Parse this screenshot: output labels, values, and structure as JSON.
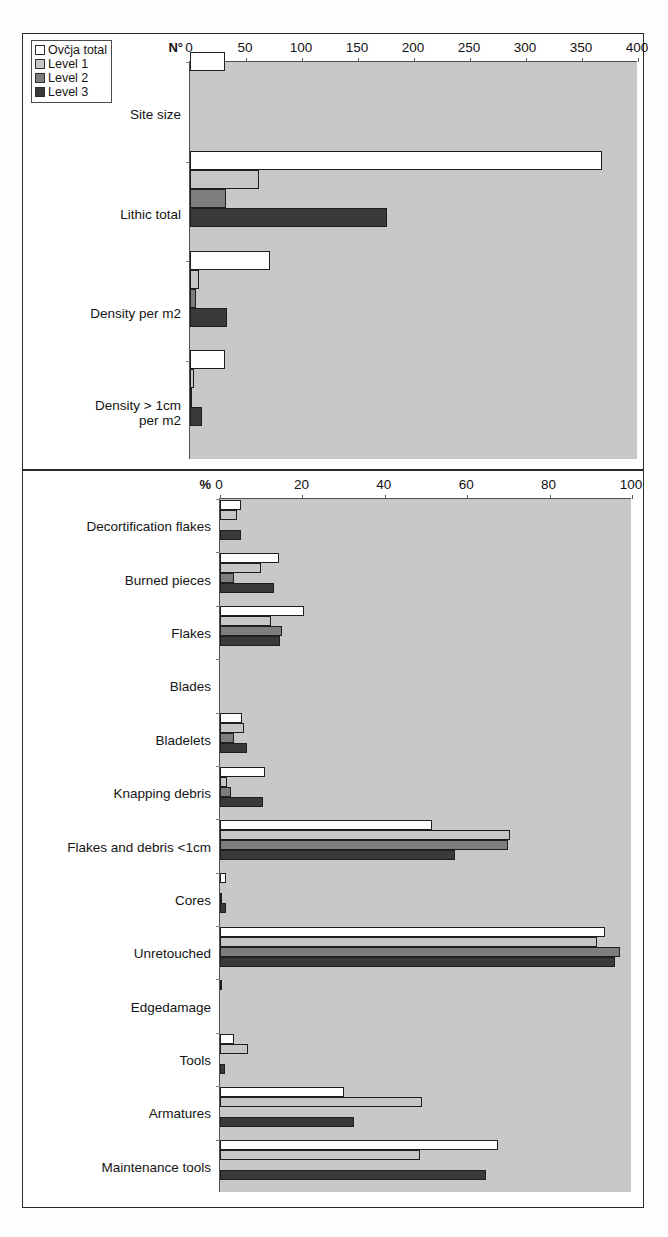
{
  "figure": {
    "title": "",
    "legend": {
      "position": "top-left",
      "items": [
        {
          "label": "Ovčja total",
          "color": "#ffffff",
          "key": "ovcja_total"
        },
        {
          "label": "Level 1",
          "color": "#c6c6c6",
          "key": "level_1"
        },
        {
          "label": "Level 2",
          "color": "#7d7d7d",
          "key": "level_2"
        },
        {
          "label": "Level 3",
          "color": "#3a3a3a",
          "key": "level_3"
        }
      ]
    }
  },
  "chart_data": [
    {
      "id": "counts-chart",
      "type": "bar",
      "orientation": "horizontal",
      "title": "",
      "xlabel": "N°",
      "ylabel": "",
      "xlim": [
        0,
        400
      ],
      "xticks": [
        0,
        50,
        100,
        150,
        200,
        250,
        300,
        350,
        400
      ],
      "tick_labels": [
        "0",
        "50",
        "100",
        "150",
        "200",
        "250",
        "300",
        "350",
        "400"
      ],
      "axis_unit": "N°",
      "grid": false,
      "legend_position": "top-left",
      "plot_background": "#c8c8c8",
      "categories": [
        "Site size",
        "Lithic total",
        "Density per m2",
        "Density > 1cm\nper m2"
      ],
      "series": [
        {
          "name": "Ovčja total",
          "color": "#ffffff",
          "values": [
            31,
            368,
            71,
            31
          ]
        },
        {
          "name": "Level 1",
          "color": "#c6c6c6",
          "values": [
            0,
            62,
            8,
            4
          ]
        },
        {
          "name": "Level 2",
          "color": "#7d7d7d",
          "values": [
            0,
            32,
            5,
            2
          ]
        },
        {
          "name": "Level 3",
          "color": "#3a3a3a",
          "values": [
            0,
            176,
            33,
            11
          ]
        }
      ]
    },
    {
      "id": "percent-chart",
      "type": "bar",
      "orientation": "horizontal",
      "title": "",
      "xlabel": "%",
      "ylabel": "",
      "xlim": [
        0,
        100
      ],
      "xticks": [
        0,
        20,
        40,
        60,
        80,
        100
      ],
      "tick_labels": [
        "0",
        "20",
        "40",
        "60",
        "80",
        "100"
      ],
      "axis_unit": "%",
      "grid": false,
      "legend_position": "none",
      "plot_background": "#c8c8c8",
      "categories": [
        "Decortification flakes",
        "Burned pieces",
        "Flakes",
        "Blades",
        "Bladelets",
        "Knapping debris",
        "Flakes and debris <1cm",
        "Cores",
        "Unretouched",
        "Edgedamage",
        "Tools",
        "Armatures",
        "Maintenance tools"
      ],
      "series": [
        {
          "name": "Ovčja total",
          "color": "#ffffff",
          "values": [
            5.1,
            14.4,
            20.5,
            0,
            5.3,
            11.0,
            51.5,
            1.5,
            93.5,
            0.6,
            3.3,
            30.0,
            67.5
          ]
        },
        {
          "name": "Level 1",
          "color": "#c6c6c6",
          "values": [
            4.2,
            10.0,
            12.3,
            0,
            5.8,
            1.8,
            70.5,
            0,
            91.5,
            0,
            6.7,
            49.0,
            48.5
          ]
        },
        {
          "name": "Level 2",
          "color": "#7d7d7d",
          "values": [
            0,
            3.3,
            15.0,
            0,
            3.3,
            2.6,
            70.0,
            0.3,
            97.0,
            0,
            0,
            0,
            0
          ]
        },
        {
          "name": "Level 3",
          "color": "#3a3a3a",
          "values": [
            5.0,
            13.0,
            14.6,
            0,
            6.5,
            10.5,
            57.0,
            1.5,
            95.8,
            0,
            1.2,
            32.5,
            64.5
          ]
        }
      ]
    }
  ]
}
